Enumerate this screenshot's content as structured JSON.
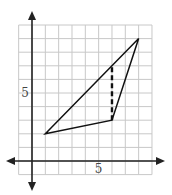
{
  "figure": {
    "type": "coordinate-grid-triangle",
    "grid": {
      "x_min": -1,
      "x_max": 9,
      "y_min": -1,
      "y_max": 10,
      "color": "#c8c8c8"
    },
    "axes": {
      "color": "#222222",
      "x_label_tick": "5",
      "y_label_tick": "5"
    },
    "triangle": {
      "vertices": [
        {
          "x": 1,
          "y": 2
        },
        {
          "x": 6,
          "y": 3
        },
        {
          "x": 8,
          "y": 9
        }
      ],
      "stroke": "#111111"
    },
    "dashed_segment": {
      "from": {
        "x": 6,
        "y": 3
      },
      "to": {
        "x": 6,
        "y": 7
      },
      "stroke": "#111111"
    }
  }
}
